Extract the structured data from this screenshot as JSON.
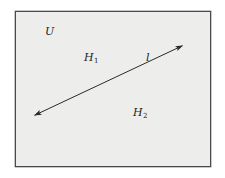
{
  "diagram": {
    "frame": {
      "label": "U",
      "left": 15,
      "top": 11,
      "right": 210,
      "bottom": 166,
      "fill": "#ededeb",
      "stroke": "#4a4a4a"
    },
    "regions": [
      {
        "id": "H1",
        "base": "H",
        "sub": "1"
      },
      {
        "id": "H2",
        "base": "H",
        "sub": "2"
      }
    ],
    "line": {
      "label": "l",
      "start": [
        33,
        116
      ],
      "end": [
        184,
        45
      ],
      "arrows": "both",
      "stroke": "#2a2a2a"
    }
  }
}
